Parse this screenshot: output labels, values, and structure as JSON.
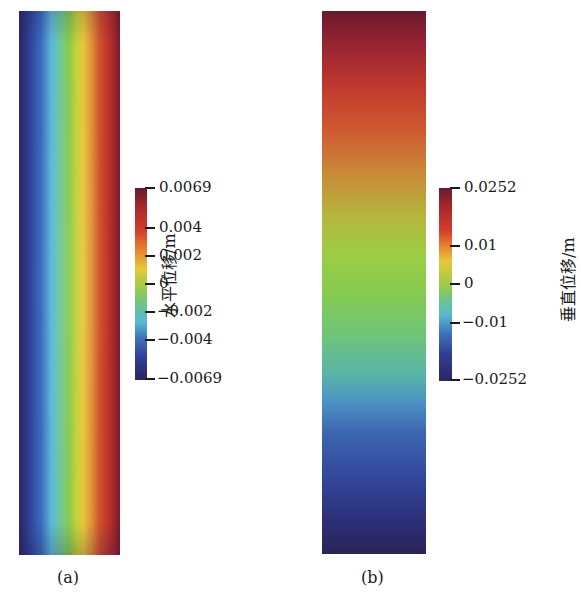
{
  "chart_data": [
    {
      "type": "heatmap",
      "panel_label": "(a)",
      "colorbar_label": "水平位移/m",
      "orientation": "horizontal gradient (varies left to right)",
      "colormap": "jet",
      "vmin": -0.0069,
      "vmax": 0.0069,
      "colorbar_ticks": [
        "0.0069",
        "0.004",
        "0.002",
        "0",
        "−0.002",
        "−0.004",
        "−0.0069"
      ],
      "colorbar_tick_values": [
        0.0069,
        0.004,
        0.002,
        0,
        -0.002,
        -0.004,
        -0.0069
      ],
      "description": "Horizontal displacement: minimum (−0.0069) at left edge, maximum (0.0069) at right edge"
    },
    {
      "type": "heatmap",
      "panel_label": "(b)",
      "colorbar_label": "垂直位移/m",
      "orientation": "vertical gradient (varies top to bottom)",
      "colormap": "jet",
      "vmin": -0.0252,
      "vmax": 0.0252,
      "colorbar_ticks": [
        "0.0252",
        "0.01",
        "0",
        "−0.01",
        "−0.0252"
      ],
      "colorbar_tick_values": [
        0.0252,
        0.01,
        0,
        -0.01,
        -0.0252
      ],
      "description": "Vertical displacement: maximum (0.0252) at top, minimum (−0.0252) at bottom"
    }
  ],
  "panels": {
    "a": {
      "label": "(a)",
      "colorbar_title": "水平位移/m",
      "ticks": [
        {
          "text": "0.0069",
          "y": 188
        },
        {
          "text": "0.004",
          "y": 228
        },
        {
          "text": "0.002",
          "y": 256
        },
        {
          "text": "0",
          "y": 284
        },
        {
          "text": "−0.002",
          "y": 312
        },
        {
          "text": "−0.004",
          "y": 340
        },
        {
          "text": "−0.0069",
          "y": 379
        }
      ]
    },
    "b": {
      "label": "(b)",
      "colorbar_title": "垂直位移/m",
      "ticks": [
        {
          "text": "0.0252",
          "y": 188
        },
        {
          "text": "0.01",
          "y": 246
        },
        {
          "text": "0",
          "y": 284
        },
        {
          "text": "−0.01",
          "y": 323
        },
        {
          "text": "−0.0252",
          "y": 380
        }
      ]
    }
  },
  "colors": {
    "min": "#2b2560",
    "low": "#3f74bc",
    "mid": "#9ccc46",
    "high": "#e8802e",
    "max": "#6a1a2e"
  }
}
